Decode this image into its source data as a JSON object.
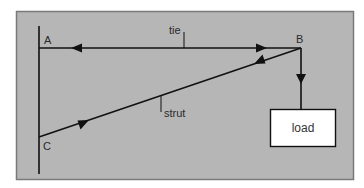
{
  "diagram": {
    "type": "force-diagram",
    "colors": {
      "panel_background": "#b6b6b6",
      "panel_border": "#7a7a7a",
      "line": "#111111",
      "load_box_fill": "#ffffff"
    },
    "nodes": {
      "A": {
        "label": "A"
      },
      "B": {
        "label": "B"
      },
      "C": {
        "label": "C"
      }
    },
    "members": {
      "tie": {
        "label": "tie",
        "from": "A",
        "to": "B"
      },
      "strut": {
        "label": "strut",
        "from": "C",
        "to": "B"
      }
    },
    "load": {
      "label": "load"
    }
  }
}
